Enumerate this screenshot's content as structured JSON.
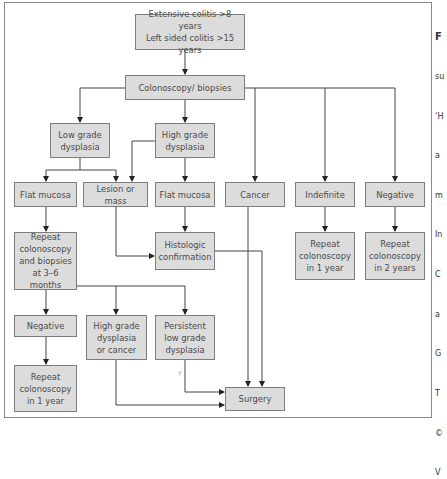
{
  "diagram": {
    "type": "flowchart",
    "nodes": {
      "start": "Extensive colitis >8 years\nLeft sided colitis >15 years",
      "colonoscopy": "Colonoscopy/ biopsies",
      "low_grade": "Low grade\ndysplasia",
      "high_grade": "High grade\ndysplasia",
      "flat_mucosa_low": "Flat mucosa",
      "lesion_mass": "Lesion or mass",
      "flat_mucosa_high": "Flat mucosa",
      "cancer": "Cancer",
      "indefinite": "Indefinite",
      "negative_top": "Negative",
      "repeat_3_6": "Repeat\ncolonoscopy\nand biopsies\nat 3–6 months",
      "histologic": "Histologic\nconfirmation",
      "repeat_1yr_indef": "Repeat\ncolonoscopy\nin 1 year",
      "repeat_2yr": "Repeat\ncolonoscopy\nin 2 years",
      "negative_bottom": "Negative",
      "hgd_or_cancer": "High grade\ndysplasia\nor cancer",
      "persistent_lgd": "Persistent\nlow grade\ndysplasia",
      "repeat_1yr_neg": "Repeat\ncolonoscopy\nin 1 year",
      "surgery": "Surgery"
    },
    "question_mark": "?",
    "edges": [
      [
        "start",
        "colonoscopy"
      ],
      [
        "colonoscopy",
        "low_grade"
      ],
      [
        "colonoscopy",
        "high_grade"
      ],
      [
        "colonoscopy",
        "cancer"
      ],
      [
        "colonoscopy",
        "indefinite"
      ],
      [
        "colonoscopy",
        "negative_top"
      ],
      [
        "low_grade",
        "flat_mucosa_low"
      ],
      [
        "low_grade",
        "lesion_mass"
      ],
      [
        "high_grade",
        "lesion_mass"
      ],
      [
        "high_grade",
        "flat_mucosa_high"
      ],
      [
        "flat_mucosa_low",
        "repeat_3_6"
      ],
      [
        "lesion_mass",
        "histologic"
      ],
      [
        "flat_mucosa_high",
        "histologic"
      ],
      [
        "indefinite",
        "repeat_1yr_indef"
      ],
      [
        "negative_top",
        "repeat_2yr"
      ],
      [
        "repeat_3_6",
        "negative_bottom"
      ],
      [
        "repeat_3_6",
        "hgd_or_cancer"
      ],
      [
        "repeat_3_6",
        "persistent_lgd"
      ],
      [
        "negative_bottom",
        "repeat_1yr_neg"
      ],
      [
        "hgd_or_cancer",
        "surgery"
      ],
      [
        "persistent_lgd",
        "surgery"
      ],
      [
        "histologic",
        "surgery"
      ],
      [
        "cancer",
        "surgery"
      ]
    ]
  },
  "caption_fragment": {
    "lines": [
      "F",
      "su",
      "‘H",
      "a",
      "m",
      "In",
      "C",
      "a",
      "G",
      "T",
      "©",
      "V"
    ]
  }
}
